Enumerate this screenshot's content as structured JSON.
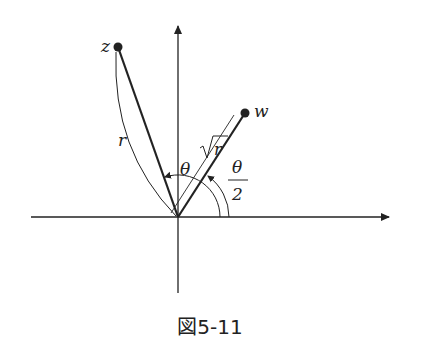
{
  "figure": {
    "caption": "図5-11",
    "points": {
      "z": {
        "label": "z"
      },
      "w": {
        "label": "w"
      }
    },
    "labels": {
      "r": "r",
      "sqrt_r": "r",
      "theta": "θ",
      "half_theta_num": "θ",
      "half_theta_den": "2"
    },
    "colors": {
      "line": "#222222",
      "background": "#ffffff"
    }
  }
}
